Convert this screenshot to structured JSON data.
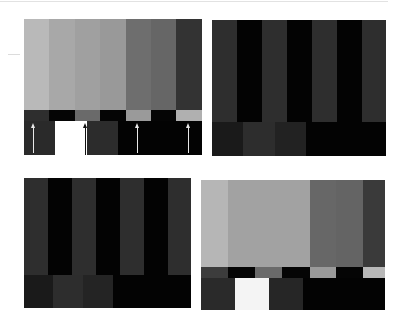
{
  "panels": [
    {
      "id": "panel-1",
      "box": {
        "left": 24,
        "top": 19,
        "width": 178,
        "height": 136
      },
      "top_bars": {
        "height": 91,
        "widths": [
          25,
          26,
          25,
          26,
          25,
          25,
          26
        ],
        "colors": [
          "#b9b9b9",
          "#a8a8a8",
          "#a0a0a0",
          "#999999",
          "#6e6e6e",
          "#666666",
          "#333333"
        ]
      },
      "strip": {
        "top": 91,
        "height": 11,
        "widths": [
          25,
          26,
          25,
          26,
          25,
          25,
          26
        ],
        "colors": [
          "#2e2e2e",
          "#050505",
          "#6a6a6a",
          "#050505",
          "#9a9a9a",
          "#050505",
          "#b0b0b0"
        ]
      },
      "bottom": {
        "top": 102,
        "height": 34,
        "widths": [
          31,
          32,
          31,
          84
        ],
        "colors": [
          "#2a2a2a",
          "#ffffff",
          "#2c2c2c",
          "#030303"
        ]
      },
      "arrows": [
        {
          "x": 9,
          "color": "#e8e8e8",
          "top": 102,
          "height": 30
        },
        {
          "x": 61,
          "color": "#111111",
          "top": 102,
          "height": 32
        },
        {
          "x": 113,
          "color": "#e8e8e8",
          "top": 102,
          "height": 30
        },
        {
          "x": 164,
          "color": "#e8e8e8",
          "top": 102,
          "height": 30
        }
      ]
    },
    {
      "id": "panel-2",
      "box": {
        "left": 212,
        "top": 20,
        "width": 174,
        "height": 136
      },
      "top_bars": {
        "height": 102,
        "widths": [
          25,
          25,
          25,
          25,
          25,
          25,
          24
        ],
        "colors": [
          "#2e2e2e",
          "#030303",
          "#2e2e2e",
          "#030303",
          "#2e2e2e",
          "#030303",
          "#2e2e2e"
        ]
      },
      "bottom": {
        "top": 102,
        "height": 34,
        "widths": [
          31,
          32,
          31,
          80
        ],
        "colors": [
          "#1a1a1a",
          "#2d2d2d",
          "#222222",
          "#030303"
        ]
      }
    },
    {
      "id": "panel-3",
      "box": {
        "left": 24,
        "top": 178,
        "width": 167,
        "height": 130
      },
      "top_bars": {
        "height": 97,
        "widths": [
          24,
          24,
          24,
          24,
          24,
          24,
          23
        ],
        "colors": [
          "#2e2e2e",
          "#030303",
          "#2e2e2e",
          "#030303",
          "#2e2e2e",
          "#030303",
          "#2e2e2e"
        ]
      },
      "bottom": {
        "top": 97,
        "height": 33,
        "widths": [
          29,
          30,
          30,
          78
        ],
        "colors": [
          "#1a1a1a",
          "#2d2d2d",
          "#242424",
          "#030303"
        ]
      }
    },
    {
      "id": "panel-4",
      "box": {
        "left": 201,
        "top": 180,
        "width": 184,
        "height": 130
      },
      "top_bars": {
        "height": 87,
        "widths": [
          27,
          27,
          27,
          28,
          26,
          27,
          22
        ],
        "colors": [
          "#b6b6b6",
          "#a2a2a2",
          "#a2a2a2",
          "#a2a2a2",
          "#676767",
          "#646464",
          "#3a3a3a"
        ]
      },
      "strip": {
        "top": 87,
        "height": 11,
        "widths": [
          27,
          27,
          27,
          28,
          26,
          27,
          22
        ],
        "colors": [
          "#3c3c3c",
          "#050505",
          "#6a6a6a",
          "#050505",
          "#9a9a9a",
          "#050505",
          "#b8b8b8"
        ]
      },
      "bottom": {
        "top": 98,
        "height": 32,
        "widths": [
          34,
          34,
          34,
          82
        ],
        "colors": [
          "#2a2a2a",
          "#f4f4f4",
          "#262626",
          "#030303"
        ]
      }
    }
  ]
}
